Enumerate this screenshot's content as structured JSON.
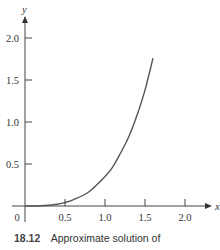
{
  "chart_data": {
    "type": "line",
    "title": "",
    "xlabel": "x",
    "ylabel": "y",
    "xlim": [
      -0.2,
      2.3
    ],
    "ylim": [
      -0.2,
      2.2
    ],
    "x_ticks": [
      0.5,
      1.0,
      1.5,
      2.0
    ],
    "x_tick_labels": [
      "0.5",
      "1.0",
      "1.5",
      "2.0"
    ],
    "y_ticks": [
      0.5,
      1.0,
      1.5,
      2.0
    ],
    "y_tick_labels": [
      "0.5",
      "1.0",
      "1.5",
      "2.0"
    ],
    "origin_label": "0",
    "grid": false,
    "legend": null,
    "series": [
      {
        "name": "approximate solution",
        "x": [
          0,
          0.2,
          0.4,
          0.5,
          0.6,
          0.8,
          1.0,
          1.1,
          1.2,
          1.3,
          1.4,
          1.5,
          1.6
        ],
        "y": [
          0,
          0.003,
          0.021,
          0.042,
          0.072,
          0.17,
          0.35,
          0.47,
          0.64,
          0.83,
          1.08,
          1.38,
          1.76
        ]
      }
    ],
    "caption": {
      "number": "18.12",
      "text": "Approximate solution of"
    }
  }
}
